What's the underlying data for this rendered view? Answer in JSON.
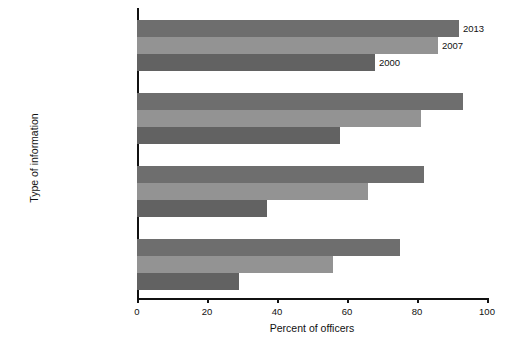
{
  "chart_data": {
    "type": "bar",
    "orientation": "horizontal",
    "title": "",
    "xlabel": "Percent of officers",
    "ylabel": "Type of information",
    "xlim": [
      0,
      100
    ],
    "xticks": [
      0,
      20,
      40,
      60,
      80,
      100
    ],
    "grid": false,
    "legend_position": "inline-annotations-first-group",
    "categories": [
      "Vehicle records",
      "Driving records",
      "Prior calls for service",
      "Criminal histories"
    ],
    "series": [
      {
        "name": "2013",
        "color": "#6e6e6e",
        "values": [
          92,
          93,
          82,
          75
        ]
      },
      {
        "name": "2007",
        "color": "#939393",
        "values": [
          86,
          81,
          66,
          56
        ]
      },
      {
        "name": "2000",
        "color": "#626262",
        "values": [
          68,
          58,
          37,
          29
        ]
      }
    ],
    "annotations": [
      {
        "text": "2013",
        "series": "2013",
        "category": "Vehicle records"
      },
      {
        "text": "2007",
        "series": "2007",
        "category": "Vehicle records"
      },
      {
        "text": "2000",
        "series": "2000",
        "category": "Vehicle records"
      }
    ]
  },
  "axes": {
    "x_title": "Percent of officers",
    "y_title": "Type of information",
    "x_tick_labels": [
      "0",
      "20",
      "40",
      "60",
      "80",
      "100"
    ]
  },
  "category_labels": {
    "0": "Vehicle records",
    "1": "Driving records",
    "2": "Prior calls for service",
    "3": "Criminal histories"
  },
  "series_labels": {
    "0": "2013",
    "1": "2007",
    "2": "2000"
  }
}
